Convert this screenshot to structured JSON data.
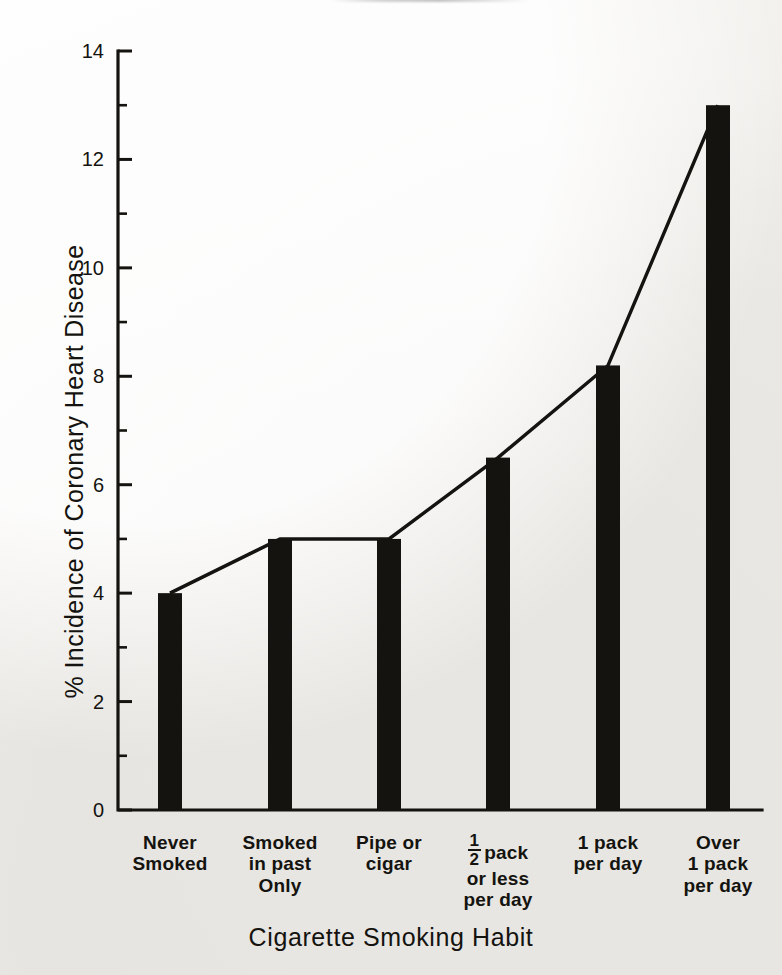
{
  "chart_data": {
    "type": "bar",
    "title": "",
    "subtitle": "",
    "xlabel": "Cigarette Smoking Habit",
    "ylabel": "% Incidence of Coronary Heart Disease",
    "categories": [
      "Never Smoked",
      "Smoked in past Only",
      "Pipe or cigar",
      "1/2 pack or less per day",
      "1 pack per day",
      "Over 1 pack per day"
    ],
    "category_lines": [
      [
        "Never",
        "Smoked"
      ],
      [
        "Smoked",
        "in past",
        "Only"
      ],
      [
        "Pipe or",
        "cigar"
      ],
      [
        "½ pack",
        "or less",
        "per day"
      ],
      [
        "1 pack",
        "per day"
      ],
      [
        "Over",
        "1 pack",
        "per day"
      ]
    ],
    "values": [
      4.0,
      5.0,
      5.0,
      6.5,
      8.2,
      13.0
    ],
    "series": [
      {
        "name": "% Incidence of Coronary Heart Disease",
        "values": [
          4.0,
          5.0,
          5.0,
          6.5,
          8.2,
          13.0
        ]
      }
    ],
    "overlay_line": {
      "present": true,
      "description": "line connecting the tops of the bars",
      "values": [
        4.0,
        5.0,
        5.0,
        6.5,
        8.2,
        13.0
      ]
    },
    "ylim": [
      0,
      14
    ],
    "y_major_ticks": [
      0,
      2,
      4,
      6,
      8,
      10,
      12,
      14
    ],
    "y_minor_ticks": [
      1,
      3,
      5,
      7,
      9,
      11,
      13
    ],
    "y_tick_labels": [
      "0",
      "2",
      "4",
      "6",
      "8",
      "10",
      "12",
      "14"
    ],
    "grid": false,
    "legend": "none",
    "bar_color": "#14130f",
    "line_color": "#14130f",
    "axis_color": "#14130f",
    "background_color": "#f2f1ef"
  },
  "figure": {
    "y_axis_title": "% Incidence of Coronary Heart Disease",
    "x_axis_title": "Cigarette Smoking Habit"
  }
}
